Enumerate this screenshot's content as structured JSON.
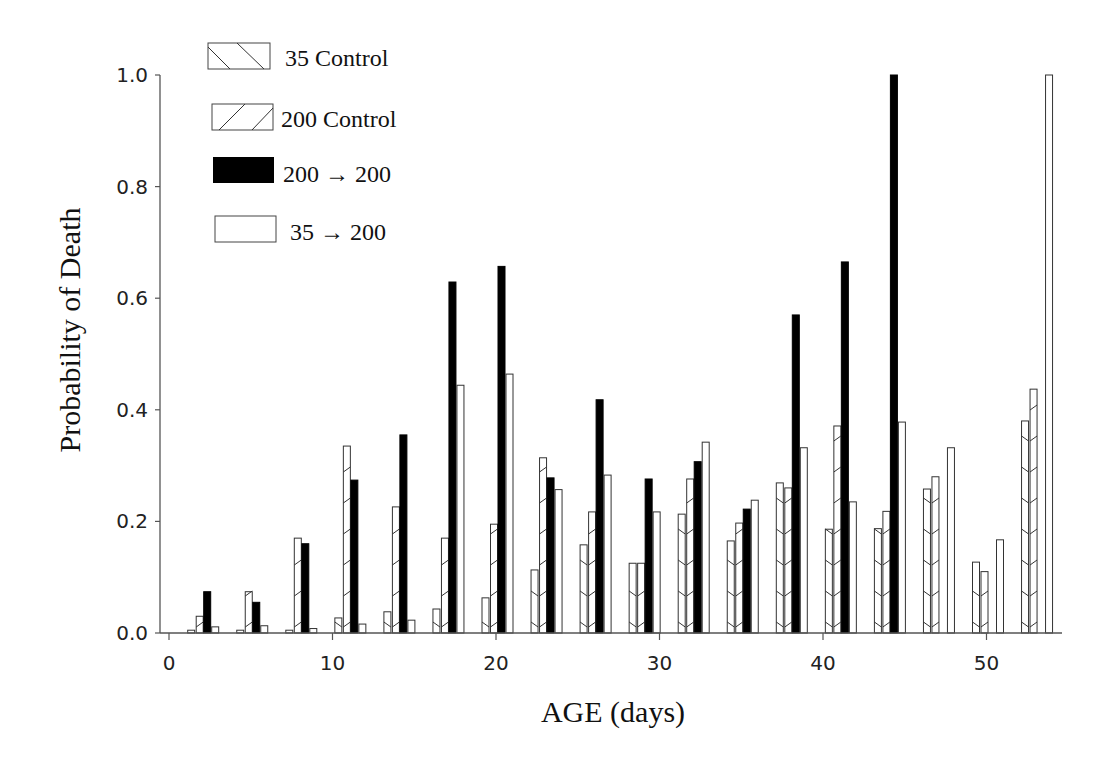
{
  "chart_data": {
    "type": "bar",
    "title": "",
    "xlabel": "AGE (days)",
    "ylabel": "Probability of Death",
    "xlim": [
      0,
      54
    ],
    "ylim": [
      0,
      1.0
    ],
    "xticks": [
      0,
      10,
      20,
      30,
      40,
      50
    ],
    "xtick_labels": [
      "0",
      "10",
      "20",
      "30",
      "40",
      "50"
    ],
    "yticks": [
      0.0,
      0.2,
      0.4,
      0.6,
      0.8,
      1.0
    ],
    "ytick_labels": [
      "0.0",
      "0.2",
      "0.4",
      "0.6",
      "0.8",
      "1.0"
    ],
    "grid": false,
    "legend_position": "upper-left",
    "categories": [
      2,
      5,
      8,
      11,
      14,
      17,
      20,
      23,
      26,
      29,
      32,
      35,
      38,
      41,
      44,
      47,
      50,
      53
    ],
    "series": [
      {
        "name": "35 Control",
        "pattern": "backslash-hatch",
        "values": [
          0.005,
          0.005,
          0.005,
          0.027,
          0.038,
          0.043,
          0.063,
          0.113,
          0.158,
          0.125,
          0.213,
          0.165,
          0.269,
          0.186,
          0.187,
          0.258,
          0.127,
          0.38
        ]
      },
      {
        "name": "200 Control",
        "pattern": "slash-hatch",
        "values": [
          0.03,
          0.074,
          0.17,
          0.335,
          0.226,
          0.17,
          0.195,
          0.314,
          0.217,
          0.125,
          0.276,
          0.197,
          0.26,
          0.371,
          0.218,
          0.28,
          0.11,
          0.437
        ]
      },
      {
        "name": "200 → 200",
        "pattern": "solid-black",
        "values": [
          0.074,
          0.055,
          0.16,
          0.274,
          0.355,
          0.629,
          0.657,
          0.278,
          0.418,
          0.276,
          0.307,
          0.222,
          0.57,
          0.665,
          1.0,
          null,
          null,
          null
        ]
      },
      {
        "name": "35 → 200",
        "pattern": "open",
        "values": [
          0.011,
          0.013,
          0.008,
          0.016,
          0.023,
          0.444,
          0.464,
          0.257,
          0.283,
          0.217,
          0.342,
          0.238,
          0.332,
          0.235,
          0.378,
          0.332,
          0.167,
          1.0
        ]
      }
    ]
  },
  "legend": {
    "items": [
      {
        "label": "35 Control",
        "pattern": "backslash-hatch"
      },
      {
        "label": "200 Control",
        "pattern": "slash-hatch"
      },
      {
        "label": "200 → 200",
        "pattern": "solid-black"
      },
      {
        "label": "35 → 200",
        "pattern": "open"
      }
    ]
  },
  "colors": {
    "bar_fill_solid": "#000000",
    "bar_outline": "#333333",
    "axis": "#555555",
    "background": "#ffffff"
  }
}
